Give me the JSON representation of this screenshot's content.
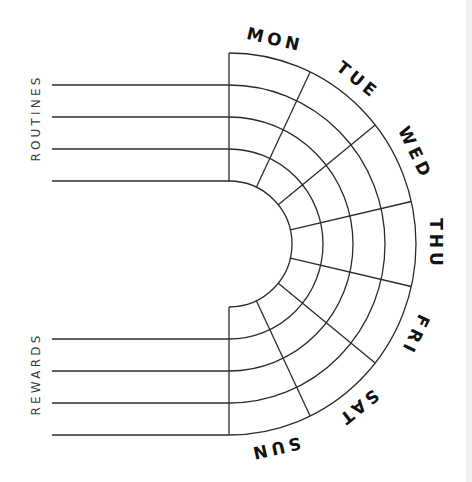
{
  "tracker": {
    "sections": [
      {
        "label": "ROUTINES",
        "row_count": 4
      },
      {
        "label": "REWARDS",
        "row_count": 4
      }
    ],
    "days": [
      "MON",
      "TUE",
      "WED",
      "THU",
      "FRI",
      "SAT",
      "SUN"
    ],
    "ring_count": 4
  },
  "colors": {
    "background": "#ffffff",
    "line": "#2b2b2b",
    "day_text": "#111111",
    "section_text": "#3a3a3a",
    "edge_strip": "#f1f1f1"
  }
}
